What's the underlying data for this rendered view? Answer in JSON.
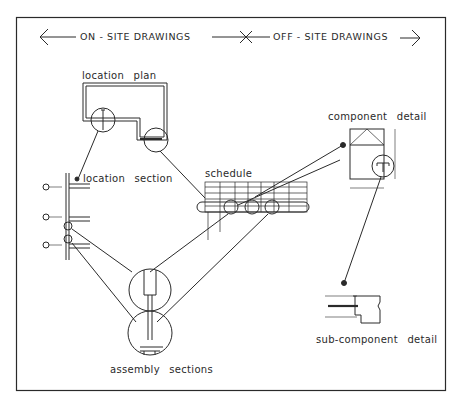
{
  "header": {
    "on_site": "ON - SITE   DRAWINGS",
    "off_site": "OFF - SITE   DRAWINGS"
  },
  "labels": {
    "location_plan": "location plan",
    "location_section": "location section",
    "schedule": "schedule",
    "component_detail": "component detail",
    "sub_component_detail": "sub-component detail",
    "assembly_sections": "assembly sections"
  },
  "colors": {
    "line": "#2a2a2a",
    "background": "#ffffff"
  }
}
